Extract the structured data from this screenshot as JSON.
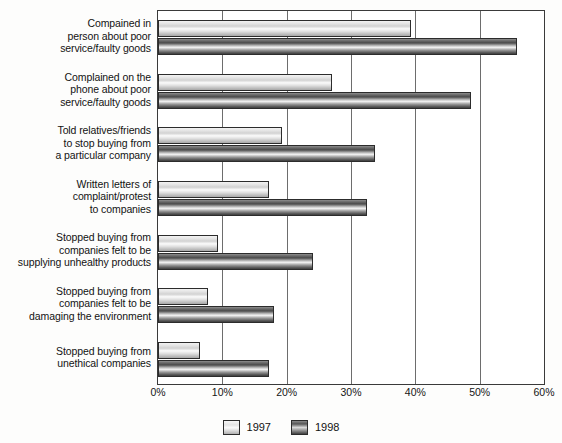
{
  "chart_data": {
    "type": "bar",
    "orientation": "horizontal",
    "title": "",
    "xlabel": "",
    "ylabel": "",
    "xlim": [
      0,
      60
    ],
    "xticks": [
      "0%",
      "10%",
      "20%",
      "30%",
      "40%",
      "50%",
      "60%"
    ],
    "xtick_values": [
      0,
      10,
      20,
      30,
      40,
      50,
      60
    ],
    "grid": true,
    "legend_position": "bottom-center",
    "categories": [
      "Compained in person about poor service/faulty goods",
      "Complained on the phone about  poor service/faulty goods",
      "Told relatives/friends to stop buying from a particular company",
      "Written letters of complaint/protest to companies",
      "Stopped buying from companies felt to be supplying unhealthy products",
      "Stopped buying from companies felt to be damaging the environment",
      "Stopped buying from unethical companies"
    ],
    "category_lines": [
      [
        "Compained in",
        "person about poor",
        "service/faulty goods"
      ],
      [
        "Complained on the",
        "phone about  poor",
        "service/faulty goods"
      ],
      [
        "Told relatives/friends",
        "to stop buying from",
        "a particular company"
      ],
      [
        "Written letters of",
        "complaint/protest",
        "to companies"
      ],
      [
        "Stopped buying from",
        "companies felt to be",
        "supplying unhealthy products"
      ],
      [
        "Stopped buying from",
        "companies felt to be",
        "damaging the environment"
      ],
      [
        "Stopped buying from",
        "unethical companies"
      ]
    ],
    "series": [
      {
        "name": "1997",
        "color": "#e0e0e0",
        "values": [
          39.4,
          27.0,
          19.2,
          17.3,
          9.4,
          7.7,
          6.6
        ]
      },
      {
        "name": "1998",
        "color": "#5c5c5c",
        "values": [
          55.8,
          48.7,
          33.8,
          32.5,
          24.1,
          18.1,
          17.2
        ]
      }
    ]
  },
  "legend": {
    "items": [
      {
        "label": "1997"
      },
      {
        "label": "1998"
      }
    ]
  },
  "colors": {
    "axis": "#3a3a3a",
    "gridline": "#6d6d6d",
    "background": "#ffffff",
    "series_1997": "#e0e0e0",
    "series_1998": "#5c5c5c"
  }
}
